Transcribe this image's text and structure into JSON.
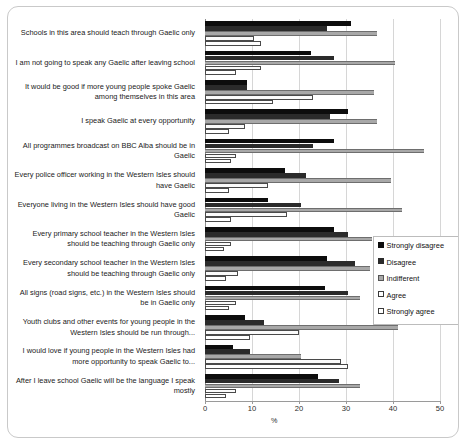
{
  "chart_data": {
    "type": "bar",
    "orientation": "horizontal",
    "title": "",
    "xlabel": "%",
    "ylabel": "",
    "xlim": [
      0,
      50
    ],
    "xticks": [
      0,
      10,
      20,
      30,
      40,
      50
    ],
    "xtick_labels": [
      "0",
      "10",
      "20",
      "30",
      "40",
      "50"
    ],
    "grid": true,
    "legend_position": "right-middle",
    "categories": [
      "Schools in this area should teach through Gaelic only",
      "I am not going to speak any Gaelic after leaving school",
      "It would be good if more young people spoke Gaelic among themselves in this area",
      "I speak Gaelic at every opportunity",
      "All programmes broadcast on BBC Alba should be in Gaelic",
      "Every police officer working in the Western Isles should have Gaelic",
      "Everyone living in the Western Isles should have good Gaelic",
      "Every primary school teacher in the Western Isles should be teaching through Gaelic only",
      "Every secondary school teacher in the Western Isles should be teaching through Gaelic only",
      "All signs (road signs, etc.) in the Western Isles should be in Gaelic only",
      "Youth clubs and other events for young people in the Western Isles should be run through...",
      "I would love if young people in the Western Isles had more opportunity to speak Gaelic to...",
      "After I leave school Gaelic will be the language I speak mostly"
    ],
    "series": [
      {
        "name": "Strongly disagree",
        "color": "#0d0d0d",
        "values": [
          31.0,
          22.5,
          9.0,
          30.5,
          27.5,
          17.0,
          13.5,
          27.5,
          26.0,
          25.5,
          8.5,
          6.0,
          24.0
        ]
      },
      {
        "name": "Disagree",
        "color": "#2b2b2b",
        "values": [
          26.0,
          27.5,
          9.0,
          26.5,
          23.0,
          21.5,
          20.5,
          30.5,
          32.0,
          30.5,
          12.5,
          9.5,
          28.5
        ]
      },
      {
        "name": "Indifferent",
        "color": "#a8a8a8",
        "values": [
          36.5,
          40.5,
          36.0,
          36.5,
          46.5,
          39.5,
          42.0,
          35.5,
          35.0,
          33.0,
          41.0,
          20.5,
          33.0
        ]
      },
      {
        "name": "Agree",
        "color": "#fbfbfb",
        "values": [
          10.5,
          12.0,
          23.0,
          8.5,
          6.5,
          13.5,
          17.5,
          5.5,
          7.0,
          6.5,
          20.0,
          29.0,
          6.5
        ]
      },
      {
        "name": "Strongly agree",
        "color": "#ffffff",
        "values": [
          12.0,
          6.5,
          14.5,
          5.0,
          5.5,
          5.0,
          5.5,
          4.0,
          4.5,
          5.0,
          9.5,
          30.5,
          4.5
        ]
      }
    ]
  },
  "legend": {
    "items": [
      {
        "label": "Strongly disagree",
        "swatch": "c0"
      },
      {
        "label": "Disagree",
        "swatch": "c1"
      },
      {
        "label": "Indifferent",
        "swatch": "c2"
      },
      {
        "label": "Agree",
        "swatch": "c3"
      },
      {
        "label": "Strongly agree",
        "swatch": "c4"
      }
    ]
  },
  "axis": {
    "x_title": "%"
  }
}
